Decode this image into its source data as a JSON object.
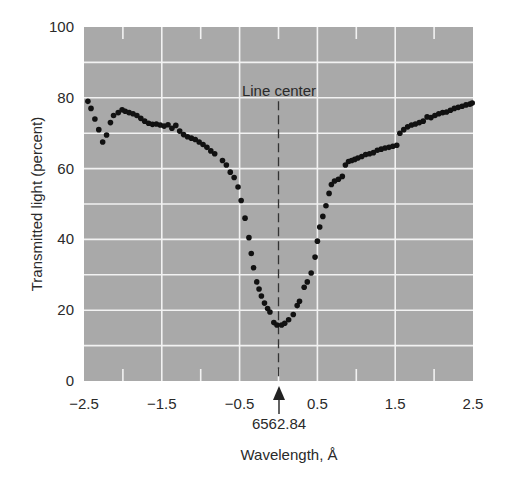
{
  "chart_data": {
    "type": "scatter",
    "title": "",
    "xlabel": "Wavelength, Å",
    "ylabel": "Transmitted light (percent)",
    "xlim": [
      -2.5,
      2.5
    ],
    "ylim": [
      0,
      100
    ],
    "x_tick_labels": [
      "−2.5",
      "−1.5",
      "−0.5",
      "0.5",
      "1.5",
      "2.5"
    ],
    "x_ticks": [
      -2.5,
      -1.5,
      -0.5,
      0.5,
      1.5,
      2.5
    ],
    "y_tick_labels": [
      "0",
      "20",
      "40",
      "60",
      "80",
      "100"
    ],
    "y_ticks": [
      0,
      20,
      40,
      60,
      80,
      100
    ],
    "grid": true,
    "minor_grid_y": [
      10,
      30,
      50,
      70,
      90
    ],
    "minor_ticks_x": [
      -2.0,
      -1.0,
      0.0,
      1.0,
      2.0
    ],
    "background_color": "#a9a9a9",
    "grid_color": "#f2f2f2",
    "marker_color": "#111111",
    "annotations": {
      "line_center_label": "Line center",
      "line_center_x": 0.0,
      "center_wavelength_label": "6562.84"
    },
    "series": [
      {
        "name": "H-alpha line profile",
        "points": [
          [
            -2.45,
            79
          ],
          [
            -2.41,
            77
          ],
          [
            -2.36,
            74
          ],
          [
            -2.31,
            71
          ],
          [
            -2.26,
            67.5
          ],
          [
            -2.21,
            69.5
          ],
          [
            -2.16,
            73
          ],
          [
            -2.12,
            75
          ],
          [
            -2.06,
            75.8
          ],
          [
            -2.01,
            76.6
          ],
          [
            -1.97,
            76.2
          ],
          [
            -1.92,
            75.8
          ],
          [
            -1.87,
            75.5
          ],
          [
            -1.82,
            75
          ],
          [
            -1.77,
            74.2
          ],
          [
            -1.72,
            73.4
          ],
          [
            -1.67,
            72.8
          ],
          [
            -1.62,
            72.5
          ],
          [
            -1.57,
            72.6
          ],
          [
            -1.52,
            72.3
          ],
          [
            -1.47,
            72
          ],
          [
            -1.42,
            72.4
          ],
          [
            -1.37,
            71.4
          ],
          [
            -1.32,
            72.2
          ],
          [
            -1.27,
            70.6
          ],
          [
            -1.22,
            69.6
          ],
          [
            -1.17,
            69
          ],
          [
            -1.12,
            68.6
          ],
          [
            -1.07,
            68.2
          ],
          [
            -1.02,
            67.5
          ],
          [
            -0.97,
            66.8
          ],
          [
            -0.92,
            66
          ],
          [
            -0.87,
            65
          ],
          [
            -0.82,
            64.2
          ],
          [
            -0.72,
            62.3
          ],
          [
            -0.67,
            61
          ],
          [
            -0.62,
            59
          ],
          [
            -0.57,
            57.5
          ],
          [
            -0.52,
            54.8
          ],
          [
            -0.48,
            51
          ],
          [
            -0.43,
            46
          ],
          [
            -0.38,
            40.5
          ],
          [
            -0.35,
            36
          ],
          [
            -0.32,
            32
          ],
          [
            -0.28,
            28
          ],
          [
            -0.25,
            26
          ],
          [
            -0.22,
            24
          ],
          [
            -0.18,
            22
          ],
          [
            -0.14,
            20.5
          ],
          [
            -0.11,
            19.5
          ],
          [
            -0.06,
            16.5
          ],
          [
            -0.02,
            15.8
          ],
          [
            0.04,
            15.8
          ],
          [
            0.08,
            16.3
          ],
          [
            0.13,
            17.3
          ],
          [
            0.19,
            18.8
          ],
          [
            0.24,
            21.3
          ],
          [
            0.27,
            22.5
          ],
          [
            0.33,
            26.5
          ],
          [
            0.37,
            28
          ],
          [
            0.42,
            30.5
          ],
          [
            0.47,
            35
          ],
          [
            0.5,
            39.5
          ],
          [
            0.53,
            43.5
          ],
          [
            0.57,
            46.5
          ],
          [
            0.61,
            49.5
          ],
          [
            0.65,
            53
          ],
          [
            0.68,
            55.5
          ],
          [
            0.72,
            56.5
          ],
          [
            0.77,
            57
          ],
          [
            0.82,
            57.8
          ],
          [
            0.86,
            61
          ],
          [
            0.9,
            62
          ],
          [
            0.94,
            62.3
          ],
          [
            0.98,
            62.6
          ],
          [
            1.02,
            63
          ],
          [
            1.07,
            63.4
          ],
          [
            1.12,
            64
          ],
          [
            1.17,
            64.2
          ],
          [
            1.22,
            64.5
          ],
          [
            1.27,
            65.2
          ],
          [
            1.32,
            65.5
          ],
          [
            1.37,
            65.8
          ],
          [
            1.42,
            66
          ],
          [
            1.47,
            66.3
          ],
          [
            1.52,
            66.6
          ],
          [
            1.56,
            70
          ],
          [
            1.61,
            71
          ],
          [
            1.66,
            71.8
          ],
          [
            1.71,
            72.3
          ],
          [
            1.76,
            72.6
          ],
          [
            1.81,
            73
          ],
          [
            1.86,
            73.4
          ],
          [
            1.91,
            74.6
          ],
          [
            1.96,
            74.4
          ],
          [
            2.01,
            75
          ],
          [
            2.06,
            75.5
          ],
          [
            2.11,
            75.8
          ],
          [
            2.16,
            76
          ],
          [
            2.21,
            76.5
          ],
          [
            2.26,
            77
          ],
          [
            2.31,
            77.3
          ],
          [
            2.36,
            77.6
          ],
          [
            2.41,
            78
          ],
          [
            2.46,
            78.2
          ],
          [
            2.49,
            78.5
          ]
        ]
      }
    ]
  }
}
